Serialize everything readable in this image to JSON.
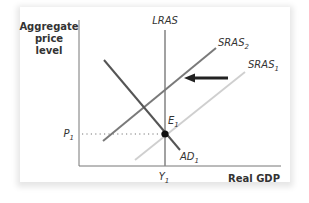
{
  "diagram": {
    "type": "AD-AS model",
    "y_axis_label": [
      "Aggregate",
      "price",
      "level"
    ],
    "x_axis_label": "Real GDP",
    "curves": [
      {
        "id": "lras",
        "label": "LRAS",
        "subscript": "",
        "color": "#888888",
        "style": "solid"
      },
      {
        "id": "sras2",
        "label": "SRAS",
        "subscript": "2",
        "color": "#777777",
        "style": "solid"
      },
      {
        "id": "sras1",
        "label": "SRAS",
        "subscript": "1",
        "color": "#cccccc",
        "style": "solid"
      },
      {
        "id": "ad1",
        "label": "AD",
        "subscript": "1",
        "color": "#555555",
        "style": "solid"
      }
    ],
    "equilibrium": {
      "label": "E",
      "subscript": "1"
    },
    "price_level": {
      "label": "P",
      "subscript": "1"
    },
    "output_level": {
      "label": "Y",
      "subscript": "1"
    },
    "shift_arrow": {
      "direction": "left",
      "from": "SRAS1",
      "to": "SRAS2",
      "color": "#222222"
    }
  }
}
